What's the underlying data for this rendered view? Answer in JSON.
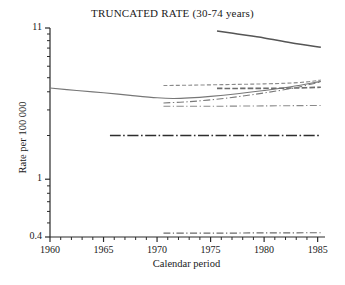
{
  "chart_data": {
    "type": "line",
    "title": "TRUNCATED RATE (30-74 years)",
    "xlabel": "Calendar period",
    "ylabel": "Rate per 100 000",
    "yscale": "log",
    "ylim": [
      0.4,
      11
    ],
    "xlim": [
      1960,
      1985.5
    ],
    "grid": false,
    "legend": "none",
    "y_tick_labels": [
      "11",
      "1",
      "0.4"
    ],
    "y_tick_values": [
      11,
      1,
      0.4
    ],
    "y_minor_ticks": [
      10,
      9,
      8,
      7,
      6,
      5,
      4,
      3,
      2,
      0.9,
      0.8,
      0.7,
      0.6,
      0.5
    ],
    "x_tick_labels": [
      "1960",
      "1965",
      "1970",
      "1975",
      "1980",
      "1985"
    ],
    "x_tick_values": [
      1960,
      1965,
      1970,
      1975,
      1980,
      1985
    ],
    "x_minor_tick_step": 1,
    "series": [
      {
        "name": "series-1-top-solid",
        "style": "solid",
        "width": 1.5,
        "color": "#555555",
        "x": [
          1975.6,
          1977.5,
          1980.0,
          1982.5,
          1985.3
        ],
        "values": [
          10.5,
          10.0,
          9.4,
          8.7,
          8.1
        ]
      },
      {
        "name": "series-2-main-solid",
        "style": "solid",
        "width": 1.1,
        "color": "#777777",
        "x": [
          1960.0,
          1962.5,
          1965.0,
          1967.5,
          1970.0,
          1971.5,
          1973.0,
          1975.0,
          1977.5,
          1980.0,
          1982.5,
          1985.3
        ],
        "values": [
          4.25,
          4.08,
          3.94,
          3.78,
          3.64,
          3.6,
          3.63,
          3.72,
          3.88,
          4.08,
          4.33,
          4.72
        ]
      },
      {
        "name": "series-3-short-dash",
        "style": "short-dash",
        "width": 1.1,
        "color": "#8a8a8a",
        "x": [
          1970.6,
          1973.0,
          1976.0,
          1979.0,
          1982.0,
          1984.0,
          1985.3
        ],
        "values": [
          4.42,
          4.44,
          4.48,
          4.52,
          4.58,
          4.68,
          4.82
        ]
      },
      {
        "name": "series-4-medium-dash",
        "style": "medium-dash",
        "width": 1.6,
        "color": "#6d6d6d",
        "x": [
          1975.6,
          1978.0,
          1981.0,
          1983.0,
          1985.3
        ],
        "values": [
          4.22,
          4.22,
          4.23,
          4.25,
          4.3
        ]
      },
      {
        "name": "series-5-dash-dot-rising",
        "style": "dash-dot",
        "width": 1.1,
        "color": "#7a7a7a",
        "x": [
          1970.6,
          1973.0,
          1975.5,
          1978.0,
          1980.5,
          1983.0,
          1985.3
        ],
        "values": [
          3.35,
          3.42,
          3.55,
          3.74,
          3.98,
          4.28,
          4.68
        ]
      },
      {
        "name": "series-6-dash-dot-flat",
        "style": "dash-dot",
        "width": 1.1,
        "color": "#8a8a8a",
        "x": [
          1970.6,
          1975.0,
          1980.0,
          1985.3
        ],
        "values": [
          3.18,
          3.18,
          3.2,
          3.22
        ]
      },
      {
        "name": "series-7-long-dash-dot",
        "style": "long-dash-dot",
        "width": 1.7,
        "color": "#2d2d2d",
        "x": [
          1965.6,
          1970.0,
          1975.0,
          1980.0,
          1985.3
        ],
        "values": [
          2.0,
          2.0,
          2.0,
          2.0,
          2.0
        ]
      },
      {
        "name": "series-8-bottom-dash-dot",
        "style": "dash-dot",
        "width": 1.2,
        "color": "#6a6a6a",
        "x": [
          1970.6,
          1975.0,
          1980.0,
          1985.3
        ],
        "values": [
          0.425,
          0.425,
          0.427,
          0.428
        ]
      }
    ]
  },
  "colors": {
    "axis": "#2b2b2b",
    "text": "#1a1a1a",
    "background": "#ffffff"
  }
}
